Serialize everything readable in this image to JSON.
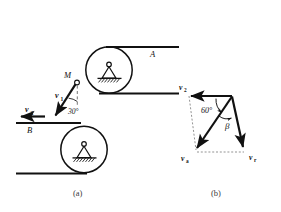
{
  "figure": {
    "background_color": "#ffffff",
    "ink_color": "#111111",
    "dash_color": "#555555",
    "panels": [
      {
        "key": "a",
        "caption": "(a)"
      },
      {
        "key": "b",
        "caption": "(b)"
      }
    ]
  },
  "panel_a": {
    "caption": "(a)",
    "belt_label_top": "A",
    "belt_label_bottom": "B",
    "point_label": "M",
    "velocity_rod_label": "v",
    "velocity_rod_sub": "1",
    "velocity_belt_label": "v",
    "velocity_belt_sub": "2",
    "angle_label": "30°",
    "rollers": [
      {
        "name": "upper-roller",
        "cx": 109,
        "cy": 70,
        "r": 23
      },
      {
        "name": "lower-roller",
        "cx": 84,
        "cy": 150,
        "r": 23
      }
    ],
    "belts": [
      {
        "name": "belt-top-upper",
        "x1": 105,
        "y1": 47,
        "x2": 178,
        "y2": 47
      },
      {
        "name": "belt-top-lower",
        "x1": 98,
        "y1": 93,
        "x2": 178,
        "y2": 93
      },
      {
        "name": "belt-bottom-upper",
        "x1": 16,
        "y1": 123,
        "x2": 80,
        "y2": 123
      },
      {
        "name": "belt-bottom-lower",
        "x1": 16,
        "y1": 173,
        "x2": 86,
        "y2": 173
      }
    ]
  },
  "panel_b": {
    "caption": "(b)",
    "vectors": [
      {
        "name": "v2",
        "label": "v",
        "sub": "2",
        "x": 181,
        "y": 89
      },
      {
        "name": "va",
        "label": "v",
        "sub": "a",
        "x": 183,
        "y": 158
      },
      {
        "name": "vr",
        "label": "v",
        "sub": "r",
        "x": 251,
        "y": 157
      }
    ],
    "angles": [
      {
        "name": "angle-60",
        "label": "60°",
        "x": 205,
        "y": 110
      },
      {
        "name": "angle-beta",
        "label": "β",
        "x": 229,
        "y": 125
      }
    ]
  }
}
